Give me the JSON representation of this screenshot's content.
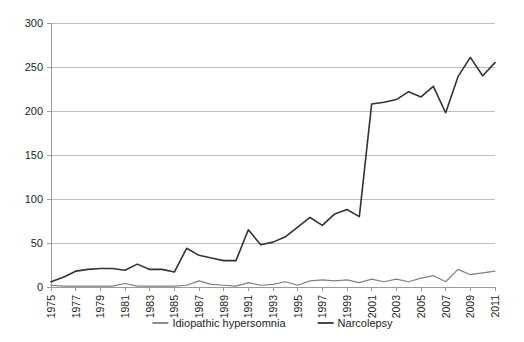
{
  "chart_data": {
    "type": "line",
    "title": "",
    "subtitle": "",
    "xlabel": "",
    "ylabel": "",
    "ylim": [
      0,
      300
    ],
    "ytick_values": [
      0,
      50,
      100,
      150,
      200,
      250,
      300
    ],
    "ytick_labels": [
      "0",
      "50",
      "100",
      "150",
      "200",
      "250",
      "300"
    ],
    "grid": true,
    "legend_position": "bottom",
    "xlim": [
      1975,
      2011
    ],
    "x": [
      1975,
      1976,
      1977,
      1978,
      1979,
      1980,
      1981,
      1982,
      1983,
      1984,
      1985,
      1986,
      1987,
      1988,
      1989,
      1990,
      1991,
      1992,
      1993,
      1994,
      1995,
      1996,
      1997,
      1998,
      1999,
      2000,
      2001,
      2002,
      2003,
      2004,
      2005,
      2006,
      2007,
      2008,
      2009,
      2010,
      2011
    ],
    "xtick_labels": [
      "1975",
      "1977",
      "1979",
      "1981",
      "1983",
      "1985",
      "1987",
      "1989",
      "1991",
      "1993",
      "1995",
      "1997",
      "1999",
      "2001",
      "2003",
      "2005",
      "2007",
      "2009",
      "2011"
    ],
    "xtick_values": [
      1975,
      1977,
      1979,
      1981,
      1983,
      1985,
      1987,
      1989,
      1991,
      1993,
      1995,
      1997,
      1999,
      2001,
      2003,
      2005,
      2007,
      2009,
      2011
    ],
    "series": [
      {
        "name": "Idiopathic hypersomnia",
        "color": "#808080",
        "values": [
          2,
          1,
          1,
          1,
          1,
          1,
          4,
          1,
          1,
          1,
          1,
          2,
          7,
          3,
          2,
          1,
          5,
          2,
          3,
          6,
          2,
          7,
          8,
          7,
          8,
          5,
          9,
          6,
          9,
          6,
          10,
          13,
          6,
          20,
          14,
          16,
          18
        ]
      },
      {
        "name": "Narcolepsy",
        "color": "#333333",
        "values": [
          6,
          11,
          18,
          20,
          21,
          21,
          19,
          26,
          20,
          20,
          17,
          44,
          36,
          33,
          30,
          30,
          65,
          48,
          51,
          57,
          68,
          79,
          70,
          83,
          88,
          80,
          208,
          210,
          213,
          222,
          216,
          228,
          198,
          239,
          261,
          240,
          255
        ]
      }
    ],
    "legend_entries": [
      {
        "label": "Idiopathic hypersomnia",
        "color": "#808080"
      },
      {
        "label": "Narcolepsy",
        "color": "#333333"
      }
    ]
  },
  "layout": {
    "plot_left": 51,
    "plot_right": 495,
    "plot_top": 23,
    "plot_bottom": 287,
    "background": "#ffffff",
    "grid_color": "#bfbfbf",
    "axis_color": "#9a9a9a"
  }
}
